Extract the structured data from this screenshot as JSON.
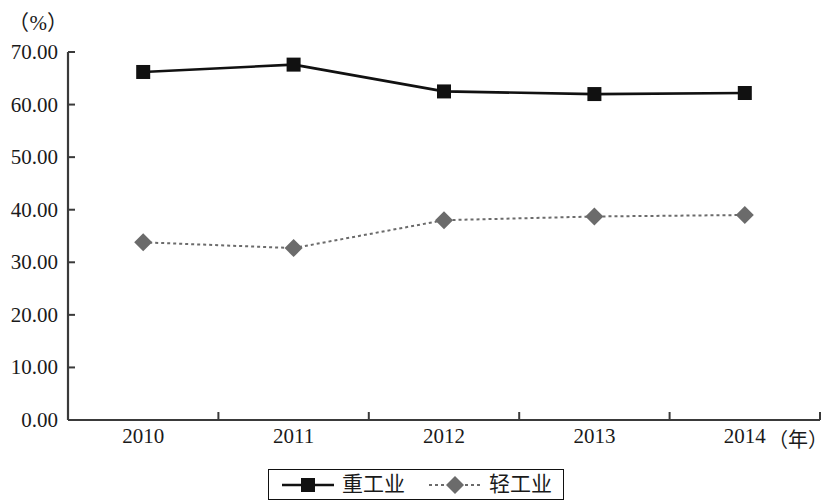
{
  "axes": {
    "y_unit_label": "（%）",
    "x_unit_label": "（年）",
    "y_ticks": [
      "70.00",
      "60.00",
      "50.00",
      "40.00",
      "30.00",
      "20.00",
      "10.00",
      "0.00"
    ],
    "x_ticks": [
      "2010",
      "2011",
      "2012",
      "2013",
      "2014"
    ]
  },
  "legend": {
    "items": [
      {
        "label": "重工业",
        "marker": "square-marker",
        "color": "#111111",
        "line_style": "solid"
      },
      {
        "label": "轻工业",
        "marker": "diamond-marker",
        "color": "#6b6b6b",
        "line_style": "dotted"
      }
    ]
  },
  "colors": {
    "heavy_industry": "#111111",
    "light_industry": "#6b6b6b",
    "axis": "#3a3a3a",
    "background": "#ffffff"
  },
  "chart_data": {
    "type": "line",
    "title": "",
    "subtitle": "",
    "xlabel": "（年）",
    "ylabel": "（%）",
    "categories": [
      "2010",
      "2011",
      "2012",
      "2013",
      "2014"
    ],
    "x": [
      2010,
      2011,
      2012,
      2013,
      2014
    ],
    "series": [
      {
        "name": "重工业",
        "values": [
          66.2,
          67.6,
          62.5,
          62.0,
          62.2
        ],
        "color": "#111111",
        "marker": "square",
        "line_style": "solid"
      },
      {
        "name": "轻工业",
        "values": [
          33.8,
          32.7,
          38.0,
          38.7,
          39.0
        ],
        "color": "#6b6b6b",
        "marker": "diamond",
        "line_style": "dotted"
      }
    ],
    "ylim": [
      0,
      70
    ],
    "ytick_step": 10,
    "grid": false,
    "legend_position": "bottom"
  }
}
